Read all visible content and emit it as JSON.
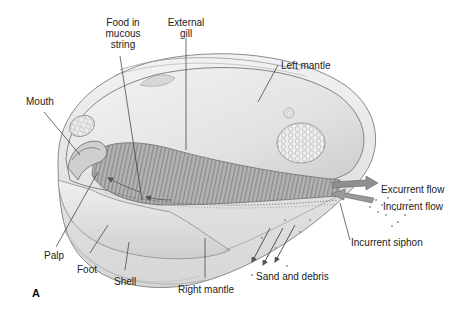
{
  "figure": {
    "panel_label": "A",
    "colors": {
      "shell": "#e9e9e9",
      "mantle": "#dcdcdc",
      "gill": "#a9a9a9",
      "gill_stripe": "#8a8a8a",
      "foot": "#e4e4e4",
      "flow_arrow": "#8c8c8c",
      "leader_line": "#333333",
      "text": "#222222"
    }
  },
  "labels": {
    "food_string": [
      "Food in",
      "mucous",
      "string"
    ],
    "external_gill": [
      "External",
      "gill"
    ],
    "left_mantle": "Left mantle",
    "mouth": "Mouth",
    "palp": "Palp",
    "foot": "Foot",
    "shell": "Shell",
    "right_mantle": "Right mantle",
    "excurrent_flow": "Excurrent flow",
    "incurrent_flow": "Incurrent flow",
    "incurrent_siphon": "Incurrent siphon",
    "sand_debris": "Sand and debris"
  }
}
